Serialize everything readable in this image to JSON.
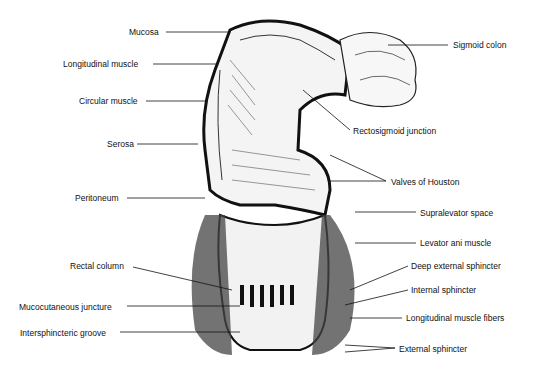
{
  "diagram": {
    "left_labels": [
      {
        "text": "Mucosa",
        "x": 129,
        "y": 27
      },
      {
        "text": "Longitudinal muscle",
        "x": 63,
        "y": 59
      },
      {
        "text": "Circular muscle",
        "x": 79,
        "y": 96
      },
      {
        "text": "Serosa",
        "x": 107,
        "y": 139
      },
      {
        "text": "Peritoneum",
        "x": 75,
        "y": 193
      },
      {
        "text": "Rectal column",
        "x": 70,
        "y": 261
      },
      {
        "text": "Mucocutaneous juncture",
        "x": 19,
        "y": 302
      },
      {
        "text": "Intersphincteric groove",
        "x": 20,
        "y": 328
      }
    ],
    "right_labels": [
      {
        "text": "Sigmoid colon",
        "x": 453,
        "y": 40
      },
      {
        "text": "Rectosigmoid junction",
        "x": 353,
        "y": 126
      },
      {
        "text": "Valves of Houston",
        "x": 391,
        "y": 177
      },
      {
        "text": "Supralevator space",
        "x": 420,
        "y": 208
      },
      {
        "text": "Levator ani muscle",
        "x": 420,
        "y": 238
      },
      {
        "text": "Deep external sphincter",
        "x": 411,
        "y": 261
      },
      {
        "text": "Internal sphincter",
        "x": 411,
        "y": 285
      },
      {
        "text": "Longitudinal muscle fibers",
        "x": 406,
        "y": 313
      },
      {
        "text": "External sphincter",
        "x": 399,
        "y": 344
      }
    ]
  }
}
